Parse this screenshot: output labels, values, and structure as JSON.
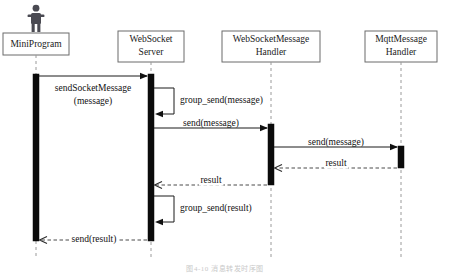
{
  "diagram": {
    "type": "uml-sequence-diagram",
    "caption": "图4-10  消息转发时序图",
    "colors": {
      "box_stroke": "#6b6b6b",
      "box_fill": "#ffffff",
      "lifeline_dash": "#9a9a9a",
      "activation_fill": "#0b0b0b",
      "message_solid": "#1a1a1a",
      "message_dashed": "#4a4a4a",
      "actor_fill": "#4a4a52",
      "text": "#111111"
    },
    "lifelines": [
      {
        "id": "miniprogram",
        "label_lines": [
          "MiniProgram"
        ],
        "is_actor": true,
        "x": 36,
        "box": {
          "x": 3,
          "y": 33,
          "w": 66,
          "h": 22
        }
      },
      {
        "id": "websocket-server",
        "label_lines": [
          "WebSocket",
          "Server"
        ],
        "is_actor": false,
        "x": 151,
        "box": {
          "x": 118,
          "y": 31,
          "w": 66,
          "h": 31
        }
      },
      {
        "id": "websocketmessage-handler",
        "label_lines": [
          "WebSocketMessage",
          "Handler"
        ],
        "is_actor": false,
        "x": 271,
        "box": {
          "x": 222,
          "y": 31,
          "w": 98,
          "h": 31
        }
      },
      {
        "id": "mqttmessage-handler",
        "label_lines": [
          "MqttMessage",
          "Handler"
        ],
        "is_actor": false,
        "x": 401,
        "box": {
          "x": 365,
          "y": 31,
          "w": 72,
          "h": 31
        }
      }
    ],
    "activations": [
      {
        "id": "act-miniprogram",
        "lifeline": "miniprogram",
        "x": 33,
        "y": 74,
        "w": 6,
        "h": 167
      },
      {
        "id": "act-websocket-server",
        "lifeline": "websocket-server",
        "x": 148,
        "y": 74,
        "w": 6,
        "h": 167
      },
      {
        "id": "act-wsmessage-handler",
        "lifeline": "websocketmessage-handler",
        "x": 268,
        "y": 124,
        "w": 6,
        "h": 61
      },
      {
        "id": "act-mqtt-handler",
        "lifeline": "mqttmessage-handler",
        "x": 398,
        "y": 146,
        "w": 6,
        "h": 22
      }
    ],
    "messages": [
      {
        "id": "msg-send-socket-message",
        "label": "sendSocketMessage",
        "label2": "(message)",
        "style": "solid",
        "direction": "right",
        "from": "miniprogram",
        "to": "websocket-server",
        "x1": 39,
        "x2": 147,
        "y": 76,
        "label_x": 93,
        "label_y": 89,
        "label2_y": 102
      },
      {
        "id": "msg-group-send-message",
        "label": "group_send(message)",
        "style": "solid",
        "direction": "self",
        "from": "websocket-server",
        "to": "websocket-server",
        "x1": 154,
        "x2": 174,
        "y1": 88,
        "y2": 114,
        "label_x": 180,
        "label_y": 101
      },
      {
        "id": "msg-send-message-to-wsmh",
        "label": "send(message)",
        "style": "solid",
        "direction": "right",
        "from": "websocket-server",
        "to": "websocketmessage-handler",
        "x1": 154,
        "x2": 267,
        "y": 128,
        "label_x": 211,
        "label_y": 124
      },
      {
        "id": "msg-send-message-to-mqtt",
        "label": "send(message)",
        "style": "solid",
        "direction": "right",
        "from": "websocketmessage-handler",
        "to": "mqttmessage-handler",
        "x1": 274,
        "x2": 397,
        "y": 147,
        "label_x": 336,
        "label_y": 143
      },
      {
        "id": "msg-result-mqtt-to-wsmh",
        "label": "result",
        "style": "dashed",
        "direction": "left",
        "from": "mqttmessage-handler",
        "to": "websocketmessage-handler",
        "x1": 397,
        "x2": 275,
        "y": 168,
        "label_x": 336,
        "label_y": 164
      },
      {
        "id": "msg-result-wsmh-to-server",
        "label": "result",
        "style": "dashed",
        "direction": "left",
        "from": "websocketmessage-handler",
        "to": "websocket-server",
        "x1": 267,
        "x2": 155,
        "y": 185,
        "label_x": 211,
        "label_y": 181
      },
      {
        "id": "msg-group-send-result",
        "label": "group_send(result)",
        "style": "solid",
        "direction": "self",
        "from": "websocket-server",
        "to": "websocket-server",
        "x1": 154,
        "x2": 174,
        "y1": 196,
        "y2": 222,
        "label_x": 180,
        "label_y": 209
      },
      {
        "id": "msg-send-result-to-miniprogram",
        "label": "send(result)",
        "style": "dashed",
        "direction": "left",
        "from": "websocket-server",
        "to": "miniprogram",
        "x1": 147,
        "x2": 40,
        "y": 240,
        "label_x": 94,
        "label_y": 240
      }
    ]
  }
}
